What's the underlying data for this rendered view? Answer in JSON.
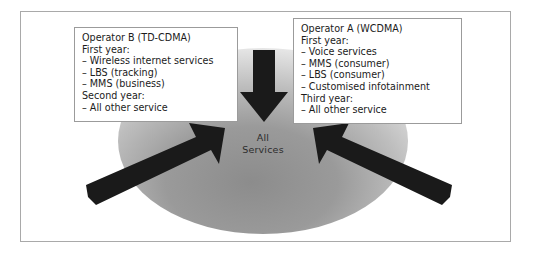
{
  "figure": {
    "center": {
      "label_line1": "All",
      "label_line2": "Services",
      "ellipse_fill_dark": "#8f8f8f",
      "ellipse_fill_light": "#e3e3e3"
    },
    "arrow_color": "#1a1a1a",
    "frame_color": "#a9a9a9",
    "boxes": [
      {
        "id": "operator-b",
        "title": "Operator B (TD-CDMA)",
        "groups": [
          {
            "heading": "First year:",
            "items": [
              "– Wireless internet services",
              "– LBS (tracking)",
              "– MMS (business)"
            ]
          },
          {
            "heading": "Second year:",
            "items": [
              "– All other service"
            ]
          }
        ]
      },
      {
        "id": "operator-a",
        "title": "Operator A (WCDMA)",
        "groups": [
          {
            "heading": "First year:",
            "items": [
              "– Voice services",
              "– MMS (consumer)",
              "– LBS (consumer)",
              "– Customised infotainment"
            ]
          },
          {
            "heading": "Third year:",
            "items": [
              "– All other service"
            ]
          }
        ]
      }
    ],
    "arrows": [
      {
        "id": "arrow-top-down",
        "direction": "down"
      },
      {
        "id": "arrow-left-up-right",
        "direction": "up-right"
      },
      {
        "id": "arrow-right-up-left",
        "direction": "up-left"
      }
    ]
  }
}
